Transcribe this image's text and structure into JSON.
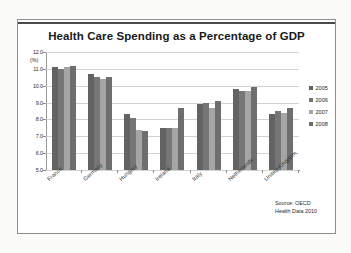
{
  "chart_data": {
    "type": "bar",
    "title": "Health Care Spending as a Percentage of GDP",
    "xlabel": "",
    "ylabel": "(%)",
    "unit_label": "(%)",
    "ylim": [
      5.0,
      12.0
    ],
    "ytick_step": 1.0,
    "ytick_labels": [
      "12.0",
      "11.0",
      "10.0",
      "9.0",
      "8.0",
      "7.0",
      "6.0",
      "5.0"
    ],
    "ytick_values": [
      12.0,
      11.0,
      10.0,
      9.0,
      8.0,
      7.0,
      6.0,
      5.0
    ],
    "grid": true,
    "legend_position": "right",
    "categories": [
      "France",
      "Germany",
      "Hungary",
      "Ireland",
      "Italy",
      "Netherlands",
      "United Kingdom"
    ],
    "series": [
      {
        "name": "2005",
        "color": "#636363",
        "values": [
          11.1,
          10.7,
          8.3,
          7.5,
          8.9,
          9.8,
          8.3
        ]
      },
      {
        "name": "2006",
        "color": "#767676",
        "values": [
          11.0,
          10.5,
          8.1,
          7.5,
          9.0,
          9.7,
          8.5
        ]
      },
      {
        "name": "2007",
        "color": "#a5a5a5",
        "values": [
          11.1,
          10.4,
          7.4,
          7.5,
          8.7,
          9.7,
          8.4
        ]
      },
      {
        "name": "2008",
        "color": "#6e6e6e",
        "values": [
          11.2,
          10.5,
          7.3,
          8.7,
          9.1,
          9.9,
          8.7
        ]
      }
    ],
    "annotations": [
      "Source: OECD",
      "Health Data 2010"
    ]
  },
  "source_note": {
    "line1": "Source: OECD",
    "line2": "Health Data 2010"
  }
}
